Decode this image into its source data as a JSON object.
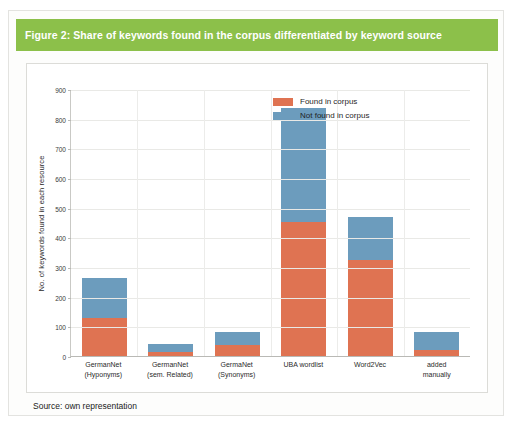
{
  "figure": {
    "header_title": "Figure 2: Share of keywords found in the corpus differentiated by keyword source",
    "source_note": "Source: own representation",
    "header_color": "#8cc04a"
  },
  "legend": {
    "position": "top-right",
    "items": [
      {
        "label": "Found in corpus",
        "color": "#df7352",
        "icon": "legend-swatch-found"
      },
      {
        "label": "Not found in corpus",
        "color": "#6c9cbd",
        "icon": "legend-swatch-not-found"
      }
    ]
  },
  "axes": {
    "yticks": [
      "0",
      "100",
      "200",
      "300",
      "400",
      "500",
      "600",
      "700",
      "800",
      "900"
    ],
    "ylabel": "No. of keywords found in each resource",
    "xlabel": ""
  },
  "chart_data": {
    "type": "bar",
    "stacked": true,
    "title": "Figure 2: Share of keywords found in the corpus differentiated by keyword source",
    "xlabel": "",
    "ylabel": "No. of keywords found in each resource",
    "ylim": [
      0,
      900
    ],
    "ytick_step": 100,
    "grid": true,
    "legend_position": "top-right",
    "categories": [
      "GermanNet (Hyponyms)",
      "GermanNet (sem. Related)",
      "GermaNet (Synonyms)",
      "UBA wordlist",
      "Word2Vec",
      "added manually"
    ],
    "category_lines": [
      [
        "GermanNet",
        "(Hyponyms)"
      ],
      [
        "GermanNet",
        "(sem. Related)"
      ],
      [
        "GermaNet",
        "(Synonyms)"
      ],
      [
        "UBA wordlist",
        ""
      ],
      [
        "Word2Vec",
        ""
      ],
      [
        "added",
        "manually"
      ]
    ],
    "series": [
      {
        "name": "Found in corpus",
        "color": "#df7352",
        "values": [
          129,
          13,
          37,
          453,
          325,
          20
        ]
      },
      {
        "name": "Not found in corpus",
        "color": "#6c9cbd",
        "values": [
          135,
          27,
          44,
          382,
          145,
          61
        ]
      }
    ],
    "totals": [
      264,
      40,
      81,
      835,
      470,
      81
    ]
  }
}
